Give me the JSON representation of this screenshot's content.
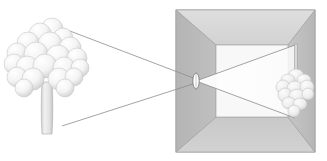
{
  "figure": {
    "background_color": "#ffffff",
    "width": 327,
    "height": 161
  },
  "palette": {
    "outline": "#9a9a9a",
    "ray_line": "#8d8d8d",
    "box_outer_frame": "#b0b0b0",
    "wall_left": "#b9b9b9",
    "wall_right": "#c2c2c2",
    "ceiling": "#d8d8d8",
    "floor": "#cdcdcd",
    "back_wall": "#f7f7f7",
    "light_cone": "#fdfdfd",
    "foliage_light": "#fdfdfd",
    "foliage_shade": "#d2d2d2",
    "trunk_light": "#ececec",
    "trunk_shade": "#c4c4c4"
  },
  "objects": {
    "tree": {
      "label": "tree",
      "position": "left",
      "orientation": "upright",
      "trunk": {
        "x": 47,
        "y_top": 78,
        "y_bottom": 135,
        "width": 10
      },
      "foliage_blobs": [
        {
          "cx": 52,
          "cy": 29,
          "r": 11
        },
        {
          "cx": 40,
          "cy": 34,
          "r": 11
        },
        {
          "cx": 63,
          "cy": 38,
          "r": 10
        },
        {
          "cx": 28,
          "cy": 43,
          "r": 11
        },
        {
          "cx": 50,
          "cy": 44,
          "r": 12
        },
        {
          "cx": 70,
          "cy": 48,
          "r": 11
        },
        {
          "cx": 17,
          "cy": 53,
          "r": 10
        },
        {
          "cx": 36,
          "cy": 54,
          "r": 12
        },
        {
          "cx": 58,
          "cy": 57,
          "r": 12
        },
        {
          "cx": 77,
          "cy": 58,
          "r": 10
        },
        {
          "cx": 14,
          "cy": 64,
          "r": 10
        },
        {
          "cx": 27,
          "cy": 67,
          "r": 11
        },
        {
          "cx": 45,
          "cy": 66,
          "r": 12
        },
        {
          "cx": 64,
          "cy": 68,
          "r": 11
        },
        {
          "cx": 80,
          "cy": 68,
          "r": 9
        },
        {
          "cx": 17,
          "cy": 77,
          "r": 10
        },
        {
          "cx": 33,
          "cy": 79,
          "r": 11
        },
        {
          "cx": 59,
          "cy": 79,
          "r": 11
        },
        {
          "cx": 74,
          "cy": 77,
          "r": 9
        },
        {
          "cx": 24,
          "cy": 88,
          "r": 9
        },
        {
          "cx": 65,
          "cy": 88,
          "r": 9
        }
      ]
    },
    "projected_image": {
      "label": "inverted tree image",
      "position": "right-wall",
      "orientation": "inverted",
      "trunk": {
        "x": 296,
        "y_top": 44,
        "y_bottom": 76,
        "width": 3
      },
      "foliage_blobs": [
        {
          "cx": 296,
          "cy": 76,
          "rx": 8,
          "ry": 7
        },
        {
          "cx": 288,
          "cy": 80,
          "rx": 7,
          "ry": 6
        },
        {
          "cx": 304,
          "cy": 80,
          "rx": 7,
          "ry": 6
        },
        {
          "cx": 283,
          "cy": 87,
          "rx": 7,
          "ry": 7
        },
        {
          "cx": 295,
          "cy": 88,
          "rx": 8,
          "ry": 7
        },
        {
          "cx": 307,
          "cy": 87,
          "rx": 7,
          "ry": 7
        },
        {
          "cx": 285,
          "cy": 95,
          "rx": 7,
          "ry": 7
        },
        {
          "cx": 297,
          "cy": 96,
          "rx": 8,
          "ry": 7
        },
        {
          "cx": 308,
          "cy": 94,
          "rx": 6,
          "ry": 6
        },
        {
          "cx": 289,
          "cy": 103,
          "rx": 7,
          "ry": 6
        },
        {
          "cx": 300,
          "cy": 104,
          "rx": 7,
          "ry": 6
        },
        {
          "cx": 294,
          "cy": 111,
          "rx": 6,
          "ry": 6
        }
      ]
    },
    "pinhole": {
      "label": "pinhole aperture",
      "cx": 196,
      "cy": 81,
      "rx": 3,
      "ry": 8
    },
    "box": {
      "label": "camera obscura box",
      "outer": {
        "x": 176,
        "y": 10,
        "width": 139,
        "height": 142
      },
      "inner": {
        "x": 216,
        "y": 45,
        "width": 72,
        "height": 72
      }
    }
  },
  "rays": {
    "label": "light rays",
    "outer": [
      {
        "name": "top-ray",
        "from": [
          62,
          28
        ],
        "to": [
          196,
          81
        ]
      },
      {
        "name": "bottom-ray",
        "from": [
          62,
          126
        ],
        "to": [
          196,
          81
        ]
      }
    ],
    "inner": [
      {
        "name": "upper-projected-ray",
        "from": [
          196,
          81
        ],
        "to": [
          295,
          45
        ]
      },
      {
        "name": "lower-projected-ray",
        "from": [
          196,
          81
        ],
        "to": [
          295,
          118
        ]
      }
    ]
  }
}
